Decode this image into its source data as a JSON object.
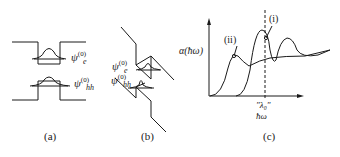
{
  "panels": [
    {
      "id": "a",
      "caption": "(a)",
      "description": "Square quantum well without field; electron and heavy-hole ground-state wavefunctions",
      "labels": {
        "psi_e": "ψ",
        "psi_e_sup": "(0)",
        "psi_e_sub": "e",
        "psi_hh": "ψ",
        "psi_hh_sup": "(0)",
        "psi_hh_sub": "hh"
      }
    },
    {
      "id": "b",
      "caption": "(b)",
      "description": "Tilted quantum well under applied electric field; wavefunctions shifted to opposite sides",
      "labels": {
        "psi_e": "ψ",
        "psi_e_sup": "(0)",
        "psi_e_sub": "e",
        "psi_hh": "ψ",
        "psi_hh_sup": "(0)",
        "psi_hh_sub": "hh"
      }
    },
    {
      "id": "c",
      "caption": "(c)",
      "description": "Absorption spectra: (i) zero field, (ii) with field (red-shifted)",
      "axis": {
        "ylabel": "α(ħω)",
        "xlabel": "ħω",
        "marker": "\"λ₀\""
      },
      "curve_labels": [
        "(i)",
        "(ii)"
      ]
    }
  ],
  "colors": {
    "line": "#1a1a1a",
    "background": "#ffffff"
  }
}
